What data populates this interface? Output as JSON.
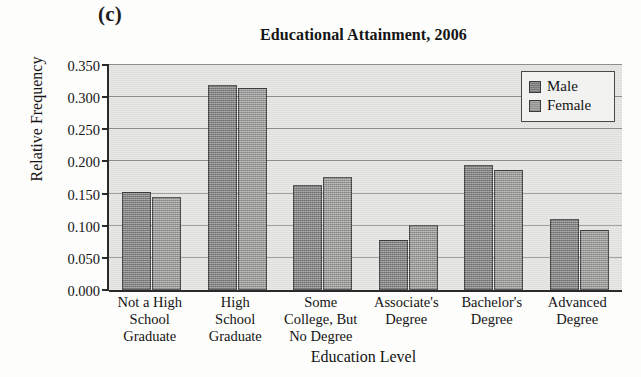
{
  "panel_letter": "(c)",
  "chart_data": {
    "type": "bar",
    "title": "Educational Attainment, 2006",
    "xlabel": "Education Level",
    "ylabel": "Relative Frequency",
    "ylim": [
      0.0,
      0.35
    ],
    "grid": true,
    "legend_position": "top-right",
    "y_ticks": [
      "0.000",
      "0.050",
      "0.100",
      "0.150",
      "0.200",
      "0.250",
      "0.300",
      "0.350"
    ],
    "y_tick_values": [
      0.0,
      0.05,
      0.1,
      0.15,
      0.2,
      0.25,
      0.3,
      0.35
    ],
    "categories": [
      "Not a High\nSchool\nGraduate",
      "High\nSchool\nGraduate",
      "Some\nCollege, But\nNo Degree",
      "Associate's\nDegree",
      "Bachelor's\nDegree",
      "Advanced\nDegree"
    ],
    "category_lines": [
      [
        "Not a High",
        "School",
        "Graduate"
      ],
      [
        "High",
        "School",
        "Graduate"
      ],
      [
        "Some",
        "College, But",
        "No Degree"
      ],
      [
        "Associate's",
        "Degree"
      ],
      [
        "Bachelor's",
        "Degree"
      ],
      [
        "Advanced",
        "Degree"
      ]
    ],
    "series": [
      {
        "name": "Male",
        "color": "#8c8c8c",
        "values": [
          0.152,
          0.319,
          0.164,
          0.078,
          0.195,
          0.111
        ]
      },
      {
        "name": "Female",
        "color": "#a3a3a1",
        "values": [
          0.144,
          0.315,
          0.176,
          0.101,
          0.187,
          0.093
        ]
      }
    ]
  }
}
